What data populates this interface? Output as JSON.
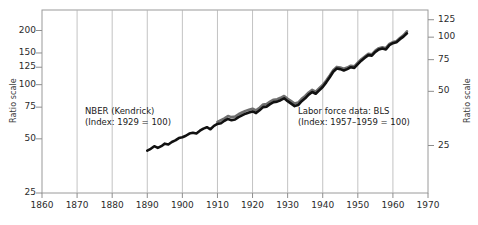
{
  "chart_data": {
    "type": "line",
    "title": "",
    "xlabel": "",
    "ylabel": "Ratio scale",
    "ylabel_right": "Ratio scale",
    "x_ticks": [
      1860,
      1870,
      1880,
      1890,
      1900,
      1910,
      1920,
      1930,
      1940,
      1950,
      1960,
      1970
    ],
    "y_ticks_left": [
      200,
      150,
      125,
      100,
      75,
      50,
      25
    ],
    "y_ticks_right": [
      125,
      100,
      75,
      50,
      25
    ],
    "xlim": [
      1860,
      1970
    ],
    "ylim_left": [
      25,
      260
    ],
    "ylim_right": [
      16,
      163
    ],
    "grid": "vertical",
    "legend_position": "inline-annotations",
    "annotations": [
      {
        "name": "nber-kendrick",
        "line1": "NBER (Kendrick)",
        "line2": "(Index: 1929 = 100)"
      },
      {
        "name": "bls-labor-force",
        "line1": "Labor force data: BLS",
        "line2": "(Index: 1957–1959 = 100)"
      }
    ],
    "series": [
      {
        "name": "NBER (Kendrick)",
        "color": "#111111",
        "x": [
          1890,
          1891,
          1892,
          1893,
          1894,
          1895,
          1896,
          1897,
          1898,
          1899,
          1900,
          1901,
          1902,
          1903,
          1904,
          1905,
          1906,
          1907,
          1908,
          1909,
          1910,
          1911,
          1912,
          1913,
          1914,
          1915,
          1916,
          1917,
          1918,
          1919,
          1920,
          1921,
          1922,
          1923,
          1924,
          1925,
          1926,
          1927,
          1928,
          1929,
          1930,
          1931,
          1932,
          1933,
          1934,
          1935,
          1936,
          1937,
          1938,
          1939,
          1940,
          1941,
          1942,
          1943,
          1944,
          1945,
          1946,
          1947,
          1948,
          1949,
          1950,
          1951,
          1952,
          1953,
          1954,
          1955,
          1956,
          1957,
          1958,
          1959,
          1960,
          1961,
          1962,
          1963,
          1964
        ],
        "values": [
          43,
          44,
          45.5,
          44.5,
          45.5,
          47,
          46.5,
          48,
          49,
          50.5,
          51,
          52,
          53.5,
          54,
          53.5,
          55.5,
          57,
          58,
          56.5,
          59,
          60.5,
          61,
          63,
          64.5,
          63.5,
          64,
          66,
          67.5,
          69,
          70,
          71,
          69.5,
          72,
          75,
          75.5,
          78,
          80,
          80.5,
          82,
          84,
          81,
          78.5,
          76,
          77,
          81,
          84,
          88,
          91,
          89,
          93,
          97,
          103,
          110,
          118,
          123,
          122,
          120,
          122,
          125,
          124,
          130,
          136,
          141,
          146,
          145,
          152,
          157,
          159,
          157,
          166,
          170,
          172,
          179,
          185,
          193
        ]
      },
      {
        "name": "Labor force data: BLS",
        "color": "#6f6f6f",
        "x": [
          1910,
          1911,
          1912,
          1913,
          1914,
          1915,
          1916,
          1917,
          1918,
          1919,
          1920,
          1921,
          1922,
          1923,
          1924,
          1925,
          1926,
          1927,
          1928,
          1929,
          1930,
          1931,
          1932,
          1933,
          1934,
          1935,
          1936,
          1937,
          1938,
          1939,
          1940,
          1941,
          1942,
          1943,
          1944,
          1945,
          1946,
          1947,
          1948,
          1949,
          1950,
          1951,
          1952,
          1953,
          1954,
          1955,
          1956,
          1957,
          1958,
          1959,
          1960,
          1961,
          1962,
          1963,
          1964
        ],
        "values": [
          62,
          63.5,
          65,
          67,
          66,
          66.5,
          68.5,
          70,
          71.5,
          72.5,
          73.5,
          72,
          74.5,
          77.5,
          78,
          80.5,
          82.5,
          83,
          84.5,
          86.5,
          83.5,
          81,
          78.5,
          79.5,
          83.5,
          86.5,
          90.5,
          93.5,
          91.5,
          95.5,
          99.5,
          105.5,
          112.5,
          120.5,
          125.5,
          124.5,
          122.5,
          124.5,
          127.5,
          126.5,
          132.5,
          138.5,
          143.5,
          148.5,
          147.5,
          154.5,
          159.5,
          161.5,
          159.5,
          168.5,
          172.5,
          174.5,
          181.5,
          188,
          198
        ]
      }
    ]
  }
}
